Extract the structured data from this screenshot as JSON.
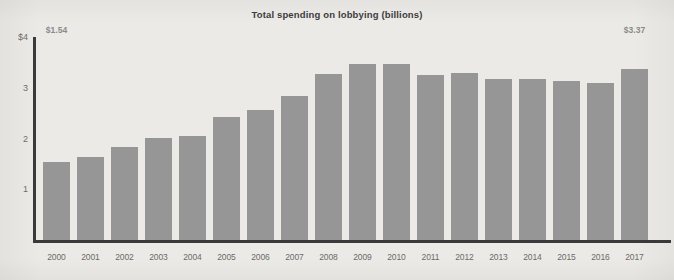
{
  "chart_data": {
    "type": "bar",
    "title": "Total spending on lobbying (billions)",
    "xlabel": "",
    "ylabel": "",
    "ylim": [
      0,
      4
    ],
    "grid": false,
    "legend": null,
    "y_ticks": [
      {
        "value": 4,
        "label": "$4"
      },
      {
        "value": 3,
        "label": "3"
      },
      {
        "value": 2,
        "label": "2"
      },
      {
        "value": 1,
        "label": "1"
      }
    ],
    "categories": [
      "2000",
      "2001",
      "2002",
      "2003",
      "2004",
      "2005",
      "2006",
      "2007",
      "2008",
      "2009",
      "2010",
      "2011",
      "2012",
      "2013",
      "2014",
      "2015",
      "2016",
      "2017"
    ],
    "values": [
      1.54,
      1.63,
      1.83,
      2.02,
      2.05,
      2.42,
      2.56,
      2.84,
      3.27,
      3.47,
      3.47,
      3.25,
      3.3,
      3.17,
      3.17,
      3.14,
      3.09,
      3.37
    ],
    "data_labels": [
      {
        "category": "2000",
        "text": "$1.54"
      },
      {
        "category": "2017",
        "text": "$3.37"
      }
    ],
    "colors": {
      "bar": "#969696",
      "axis": "#3a3a3a",
      "background": "#eceae7",
      "title_text": "#3d3d3d",
      "tick_text": "#6a6a6a",
      "label_text": "#8a8a8a"
    }
  }
}
